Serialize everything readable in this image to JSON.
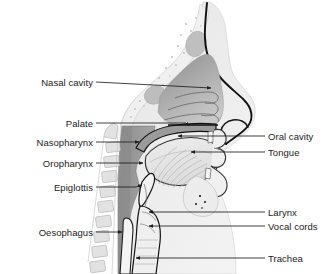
{
  "figure": {
    "background_color": "#ffffff",
    "line_color": "#3a3a3a",
    "outline_color": "#111111",
    "text_color": "#1b1b1b",
    "shade_dark": "#8f8f8f",
    "shade_mid": "#b4b4b4",
    "shade_light": "#d8d8d8",
    "shade_pale": "#ececec"
  },
  "labels": {
    "left": [
      {
        "id": "nasal-cavity",
        "text": "Nasal cavity",
        "x": 93,
        "y": 82,
        "leader_to_x": 213,
        "leader_to_y": 88,
        "arrow": true
      },
      {
        "id": "palate",
        "text": "Palate",
        "x": 93,
        "y": 123,
        "leader_to_x": 190,
        "leader_to_y": 127,
        "arrow": true
      },
      {
        "id": "nasopharynx",
        "text": "Nasopharynx",
        "x": 93,
        "y": 142,
        "leader_to_x": 141,
        "leader_to_y": 142,
        "arrow": true
      },
      {
        "id": "oropharynx",
        "text": "Oropharynx",
        "x": 93,
        "y": 163,
        "leader_to_x": 145,
        "leader_to_y": 163,
        "arrow": true
      },
      {
        "id": "epiglottis",
        "text": "Epiglottis",
        "x": 93,
        "y": 187,
        "leader_to_x": 143,
        "leader_to_y": 187,
        "arrow": true
      },
      {
        "id": "oesophagus",
        "text": "Oesophagus",
        "x": 93,
        "y": 232,
        "leader_to_x": 124,
        "leader_to_y": 232,
        "arrow": true
      }
    ],
    "right": [
      {
        "id": "oral-cavity",
        "text": "Oral cavity",
        "x": 268,
        "y": 136,
        "leader_to_x": 176,
        "leader_to_y": 136,
        "arrow": true
      },
      {
        "id": "tongue",
        "text": "Tongue",
        "x": 268,
        "y": 152,
        "leader_to_x": 189,
        "leader_to_y": 152,
        "arrow": true
      },
      {
        "id": "larynx",
        "text": "Larynx",
        "x": 268,
        "y": 212,
        "leader_to_x": 147,
        "leader_to_y": 212,
        "arrow": true
      },
      {
        "id": "vocal-cords",
        "text": "Vocal cords",
        "x": 268,
        "y": 226,
        "leader_to_x": 147,
        "leader_to_y": 226,
        "arrow": true
      },
      {
        "id": "trachea",
        "text": "Trachea",
        "x": 268,
        "y": 258,
        "leader_to_x": 134,
        "leader_to_y": 258,
        "arrow": true
      }
    ]
  }
}
